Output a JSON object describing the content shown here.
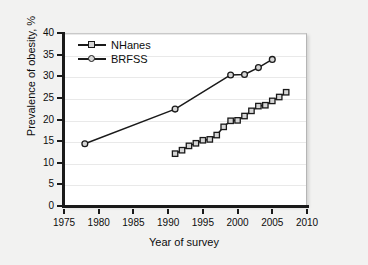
{
  "figure": {
    "background_color": "#f2f2f1",
    "plot_background_color": "#ffffff",
    "line_color": "#1a1a1a",
    "marker_fill_color": "#d6d6d6",
    "gridline_color": "#e9e9e9"
  },
  "chart_data": {
    "type": "line",
    "title": "",
    "xlabel": "Year of survey",
    "ylabel": "Prevalence of obesity, %",
    "xlim": [
      1975,
      2010
    ],
    "ylim": [
      0,
      40
    ],
    "xticks": [
      1975,
      1980,
      1985,
      1990,
      1995,
      2000,
      2005,
      2010
    ],
    "yticks": [
      0,
      5,
      10,
      15,
      20,
      25,
      30,
      35,
      40
    ],
    "xtick_labels": [
      "1975",
      "1980",
      "1985",
      "1990",
      "1995",
      "2000",
      "2005",
      "2010"
    ],
    "ytick_labels": [
      "0",
      "5",
      "10",
      "15",
      "20",
      "25",
      "30",
      "35",
      "40"
    ],
    "grid": "horizontal",
    "legend_position": "upper left",
    "series": [
      {
        "name": "NHanes",
        "marker": "square",
        "x": [
          1991,
          1992,
          1993,
          1994,
          1995,
          1996,
          1997,
          1998,
          1999,
          2000,
          2001,
          2002,
          2003,
          2004,
          2005,
          2006,
          2007
        ],
        "y": [
          12.1,
          12.9,
          13.9,
          14.5,
          15.2,
          15.4,
          16.4,
          18.3,
          19.7,
          19.8,
          20.8,
          22.0,
          23.1,
          23.3,
          24.3,
          25.2,
          26.3
        ]
      },
      {
        "name": "BRFSS",
        "marker": "circle",
        "x": [
          1978,
          1991,
          1999,
          2001,
          2003,
          2005
        ],
        "y": [
          14.4,
          22.4,
          30.3,
          30.4,
          32.0,
          33.9
        ]
      }
    ]
  }
}
